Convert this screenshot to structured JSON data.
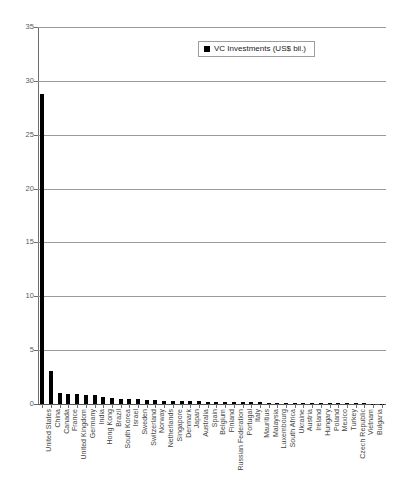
{
  "chart_data": {
    "type": "bar",
    "title": "",
    "subtitle": "",
    "xlabel": "",
    "ylabel": "",
    "ylim": [
      0,
      35
    ],
    "yticks": [
      0,
      5,
      10,
      15,
      20,
      25,
      30,
      35
    ],
    "grid": true,
    "legend_position": "top-center",
    "bar_color": "#000000",
    "series": [
      {
        "name": "VC Investments (US$ bil.)",
        "values": [
          28.8,
          3.1,
          1.05,
          0.95,
          0.9,
          0.85,
          0.8,
          0.62,
          0.55,
          0.5,
          0.46,
          0.42,
          0.38,
          0.35,
          0.32,
          0.3,
          0.28,
          0.26,
          0.24,
          0.22,
          0.2,
          0.19,
          0.18,
          0.17,
          0.16,
          0.15,
          0.14,
          0.13,
          0.12,
          0.11,
          0.1,
          0.09,
          0.08,
          0.07,
          0.065,
          0.06,
          0.055,
          0.05,
          0.04,
          0.03
        ]
      }
    ],
    "categories": [
      "United States",
      "China",
      "Canada",
      "France",
      "United Kingdom",
      "Germany",
      "India",
      "Hong Kong",
      "Brazil",
      "South Korea",
      "Israel",
      "Sweden",
      "Switzerland",
      "Norway",
      "Netherlands",
      "Singapore",
      "Denmark",
      "Japan",
      "Australia",
      "Spain",
      "Belgium",
      "Finland",
      "Russian Federation",
      "Portugal",
      "Italy",
      "Mauritius",
      "Malaysia",
      "Luxembourg",
      "South Africa",
      "Ukraine",
      "Austria",
      "Ireland",
      "Hungary",
      "Poland",
      "Mexico",
      "Turkey",
      "Czech Republic",
      "Vietnam",
      "Bulgaria",
      ""
    ]
  },
  "legend": {
    "entries": [
      {
        "label": "VC Investments (US$ bil.)",
        "color": "#000000"
      }
    ]
  },
  "axis": {
    "y_tick_labels": [
      "35",
      "30",
      "25",
      "20",
      "15",
      "10",
      "5",
      "0"
    ]
  }
}
